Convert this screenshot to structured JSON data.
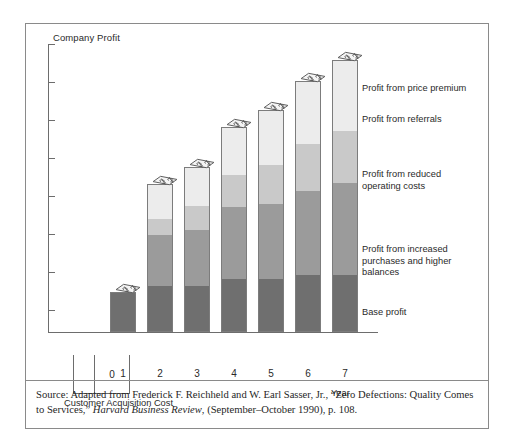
{
  "chart_data": {
    "type": "bar",
    "subtype": "stacked-bar",
    "title": "",
    "ylabel": "Company Profit",
    "xlabel": "Year",
    "categories": [
      "1",
      "2",
      "3",
      "4",
      "5",
      "6",
      "7"
    ],
    "grid": false,
    "legend_position": "right-inline",
    "axis_note": "Y axis is unlabeled (qualitative); 7 unlabeled tick marks",
    "y_tick_count": 7,
    "series": [
      {
        "name": "Base profit",
        "color": "#6f6f6f",
        "values": [
          38,
          44,
          44,
          50,
          50,
          54,
          54
        ]
      },
      {
        "name": "Profit from increased purchases and higher balances",
        "color": "#9b9b9b",
        "values": [
          0,
          49,
          54,
          70,
          73,
          82,
          89
        ]
      },
      {
        "name": "Profit from reduced operating costs",
        "color": "#c9c9c9",
        "values": [
          0,
          16,
          23,
          31,
          38,
          45,
          50
        ]
      },
      {
        "name": "Profit from referrals",
        "color": "#ececec",
        "values": [
          0,
          33,
          37,
          45,
          52,
          60,
          68
        ]
      },
      {
        "name": "Profit from price premium",
        "color": "#f7f7f7",
        "values": [
          0,
          0,
          0,
          0,
          0,
          0,
          0
        ]
      }
    ],
    "totals": [
      38,
      142,
      158,
      196,
      213,
      241,
      261
    ]
  },
  "figure": {
    "y_axis_title": "Company Profit",
    "x_axis_title": "Year",
    "acquisition": {
      "zero_label": "0",
      "caption": "Customer Acquisition Cost"
    },
    "x_tick_labels": [
      "1",
      "2",
      "3",
      "4",
      "5",
      "6",
      "7"
    ],
    "legend_labels": [
      "Profit from price premium",
      "Profit from referrals",
      "Profit from reduced\noperating costs",
      "Profit from increased\npurchases and higher balances",
      "Base profit"
    ],
    "money_icon_name": "money-dollar-icon"
  },
  "source": {
    "prefix": "Source: Adapted from Frederick F. Reichheld and W. Earl Sasser, Jr., “Zero Defections: Quality Comes to Services,” ",
    "italic": "Harvard Business Review",
    "suffix": ", (September–October 1990), p. 108."
  },
  "colors": {
    "base_profit": "#6f6f6f",
    "increased_purchases": "#9b9b9b",
    "reduced_costs": "#c9c9c9",
    "referrals": "#ececec",
    "price_premium": "#f7f7f7",
    "frame": "#8a8a8a",
    "axis": "#6d6d6d",
    "text": "#2a2a2a"
  }
}
